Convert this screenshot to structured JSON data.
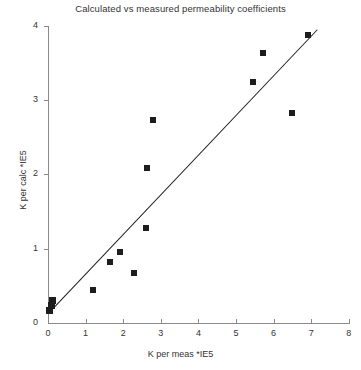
{
  "chart_data": {
    "type": "scatter",
    "title": "Calculated vs measured permeability coefficients",
    "xlabel": "K per meas *IE5",
    "ylabel": "K per calc *IE5",
    "xlim": [
      0,
      8
    ],
    "ylim": [
      0,
      4
    ],
    "xticks": [
      0,
      1,
      2,
      3,
      4,
      5,
      6,
      7,
      8
    ],
    "yticks": [
      0,
      1,
      2,
      3,
      4
    ],
    "grid": false,
    "legend": null,
    "marker": "filled-square",
    "marker_color": "#1d1d1d",
    "points": [
      {
        "x": 0.05,
        "y": 0.17
      },
      {
        "x": 0.08,
        "y": 0.24
      },
      {
        "x": 0.12,
        "y": 0.3
      },
      {
        "x": 1.2,
        "y": 0.44
      },
      {
        "x": 1.65,
        "y": 0.82
      },
      {
        "x": 1.92,
        "y": 0.95
      },
      {
        "x": 2.28,
        "y": 0.67
      },
      {
        "x": 2.6,
        "y": 1.28
      },
      {
        "x": 2.62,
        "y": 2.09
      },
      {
        "x": 2.8,
        "y": 2.73
      },
      {
        "x": 5.45,
        "y": 3.25
      },
      {
        "x": 5.72,
        "y": 3.63
      },
      {
        "x": 6.5,
        "y": 2.83
      },
      {
        "x": 6.92,
        "y": 3.87
      }
    ],
    "trendline": {
      "x0": 0.05,
      "y0": 0.16,
      "x1": 7.15,
      "y1": 3.95
    }
  }
}
